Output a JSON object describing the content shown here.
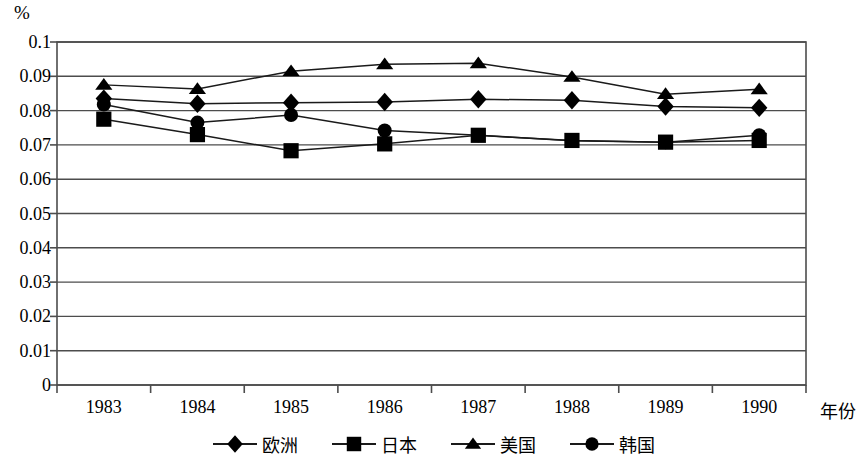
{
  "chart_data": {
    "type": "line",
    "title": "",
    "subtitle": "",
    "unit_label": "%",
    "xlabel": "年份",
    "ylabel": "",
    "categories": [
      "1983",
      "1984",
      "1985",
      "1986",
      "1987",
      "1988",
      "1989",
      "1990"
    ],
    "x": [
      1983,
      1984,
      1985,
      1986,
      1987,
      1988,
      1989,
      1990
    ],
    "ylim": [
      0,
      0.1
    ],
    "ytick_labels": [
      "0.1",
      "0.09",
      "0.08",
      "0.07",
      "0.06",
      "0.05",
      "0.04",
      "0.03",
      "0.02",
      "0.01",
      "0"
    ],
    "ytick_values": [
      0.1,
      0.09,
      0.08,
      0.07,
      0.06,
      0.05,
      0.04,
      0.03,
      0.02,
      0.01,
      0
    ],
    "grid": true,
    "grid_axis": "y",
    "legend_position": "bottom",
    "series": [
      {
        "name": "欧洲",
        "marker": "diamond",
        "color": "#000000",
        "values": [
          0.0835,
          0.082,
          0.0823,
          0.0825,
          0.0833,
          0.083,
          0.0812,
          0.0808
        ]
      },
      {
        "name": "日本",
        "marker": "square",
        "color": "#000000",
        "values": [
          0.0775,
          0.073,
          0.0683,
          0.0703,
          0.0728,
          0.0713,
          0.0708,
          0.0713
        ]
      },
      {
        "name": "美国",
        "marker": "triangle",
        "color": "#000000",
        "values": [
          0.0875,
          0.0863,
          0.0915,
          0.0935,
          0.0938,
          0.0898,
          0.0848,
          0.0862
        ]
      },
      {
        "name": "韩国",
        "marker": "circle",
        "color": "#000000",
        "values": [
          0.0818,
          0.0765,
          0.0787,
          0.0742,
          0.0728,
          0.0712,
          0.0708,
          0.0728
        ]
      }
    ]
  },
  "plot": {
    "left": 57,
    "right": 806,
    "top": 42,
    "bottom": 385,
    "frame_color": "#4d4d4d",
    "gridline_color": "#4d4d4d",
    "line_color": "#1a1a1a"
  }
}
